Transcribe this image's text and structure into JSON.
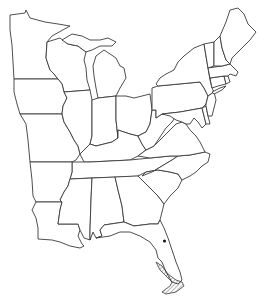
{
  "map": {
    "type": "outline-map",
    "region": "Eastern United States",
    "background": "#ffffff",
    "line_color": "#3a3a3a",
    "states": [
      {
        "name": "Minnesota"
      },
      {
        "name": "Wisconsin"
      },
      {
        "name": "Michigan"
      },
      {
        "name": "Iowa"
      },
      {
        "name": "Missouri"
      },
      {
        "name": "Arkansas"
      },
      {
        "name": "Louisiana"
      },
      {
        "name": "Illinois"
      },
      {
        "name": "Indiana"
      },
      {
        "name": "Ohio"
      },
      {
        "name": "Kentucky"
      },
      {
        "name": "Tennessee"
      },
      {
        "name": "Mississippi"
      },
      {
        "name": "Alabama"
      },
      {
        "name": "Georgia"
      },
      {
        "name": "Florida"
      },
      {
        "name": "South Carolina"
      },
      {
        "name": "North Carolina"
      },
      {
        "name": "Virginia"
      },
      {
        "name": "West Virginia"
      },
      {
        "name": "Pennsylvania"
      },
      {
        "name": "New York"
      },
      {
        "name": "Maryland"
      },
      {
        "name": "Delaware"
      },
      {
        "name": "New Jersey"
      },
      {
        "name": "Connecticut"
      },
      {
        "name": "Rhode Island"
      },
      {
        "name": "Massachusetts"
      },
      {
        "name": "Vermont"
      },
      {
        "name": "New Hampshire"
      },
      {
        "name": "Maine"
      }
    ],
    "annotations": [
      {
        "kind": "point",
        "location": "central Florida",
        "color": "#1a1a1a"
      },
      {
        "kind": "hatched-region",
        "location": "south Florida / Florida Keys"
      }
    ]
  }
}
